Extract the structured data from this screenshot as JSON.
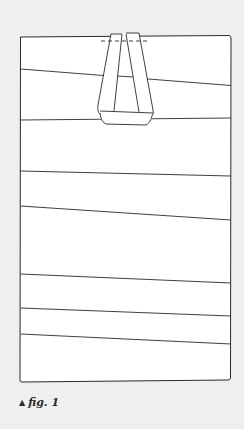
{
  "figure": {
    "caption_marker": "▲",
    "caption": "fig. 1",
    "stroke_color": "#2a2a2a",
    "panel_fill": "#ffffff",
    "background": "#efefef"
  }
}
